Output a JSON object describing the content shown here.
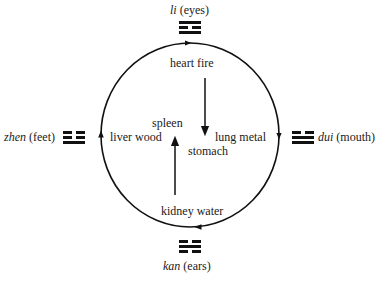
{
  "diagram": {
    "cycle_labels": {
      "top": "heart fire",
      "right": "lung metal",
      "bottom": "kidney water",
      "left": "liver wood"
    },
    "center_labels": {
      "spleen": "spleen",
      "stomach": "stomach"
    },
    "trigrams": {
      "li": {
        "name": "li",
        "meaning": "(eyes)",
        "lines_top_to_bottom": [
          "solid",
          "broken",
          "solid"
        ]
      },
      "dui": {
        "name": "dui",
        "meaning": "(mouth)",
        "lines_top_to_bottom": [
          "broken",
          "solid",
          "solid"
        ]
      },
      "kan": {
        "name": "kan",
        "meaning": "(ears)",
        "lines_top_to_bottom": [
          "broken",
          "solid",
          "broken"
        ]
      },
      "zhen": {
        "name": "zhen",
        "meaning": "(feet)",
        "lines_top_to_bottom": [
          "broken",
          "broken",
          "solid"
        ]
      }
    },
    "arrows": {
      "circle_direction": "clockwise",
      "heart_to_stomach": "down",
      "kidney_to_spleen": "up"
    },
    "colors": {
      "stroke": "#111111",
      "background": "#ffffff"
    }
  }
}
